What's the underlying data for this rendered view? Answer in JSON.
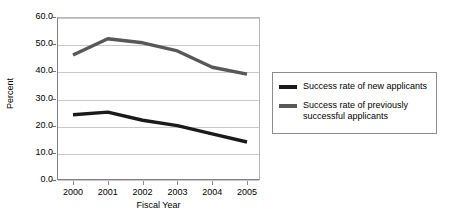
{
  "chart_data": {
    "type": "line",
    "title": "",
    "xlabel": "Fiscal Year",
    "ylabel": "Percent",
    "x": [
      "2000",
      "2001",
      "2002",
      "2003",
      "2004",
      "2005"
    ],
    "categories": [
      "2000",
      "2001",
      "2002",
      "2003",
      "2004",
      "2005"
    ],
    "ylim": [
      0.0,
      60.0
    ],
    "yticks": [
      "0.0",
      "10.0",
      "20.0",
      "30.0",
      "40.0",
      "50.0",
      "60.0"
    ],
    "ytick_values": [
      0.0,
      10.0,
      20.0,
      30.0,
      40.0,
      50.0,
      60.0
    ],
    "grid": true,
    "legend_position": "right",
    "series": [
      {
        "name": "Success rate of new applicants",
        "color": "#1a1a1a",
        "values": [
          24.0,
          25.0,
          22.0,
          20.0,
          17.0,
          14.0
        ]
      },
      {
        "name": "Success rate of previously successful applicants",
        "color": "#585858",
        "values": [
          46.0,
          52.0,
          50.5,
          47.5,
          41.5,
          39.0
        ]
      }
    ]
  },
  "legend": {
    "entries": [
      {
        "label": "Success rate of new applicants",
        "color": "#1a1a1a"
      },
      {
        "label": "Success rate of previously successful applicants",
        "color": "#585858"
      }
    ]
  },
  "colors": {
    "background": "#ffffff",
    "gridline": "#c9c9c9",
    "axis": "#808080",
    "series_new": "#1a1a1a",
    "series_previous": "#585858"
  }
}
